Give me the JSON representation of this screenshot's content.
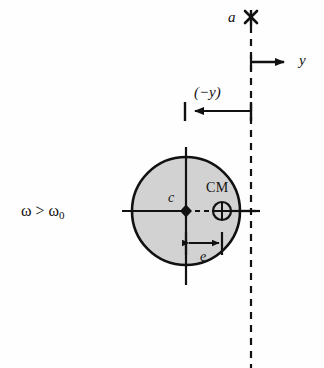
{
  "figure": {
    "type": "physics-diagram",
    "labels": {
      "axis_point": "a",
      "y_axis": "y",
      "displacement": "(−y)",
      "geometric_center": "c",
      "center_of_mass": "CM",
      "eccentricity": "e",
      "condition_omega": "ω",
      "condition_operator": ">",
      "condition_omega0": "ω",
      "condition_omega0_sub": "0"
    },
    "geometry": {
      "disk_center_x": 186,
      "disk_center_y": 211,
      "disk_radius": 54,
      "bearing_line_x": 251,
      "cm_x": 222,
      "cm_y": 211,
      "cm_radius": 9,
      "y_arrow_y": 62,
      "y_arrow_end_x": 292,
      "dim_neg_y_y": 111,
      "dim_neg_y_left_x": 185,
      "dim_e_y": 243,
      "vertical_center_top_y": 147,
      "vertical_center_bottom_y": 285,
      "h_axis_left_x": 122,
      "h_axis_right_x": 256
    },
    "colors": {
      "disk_fill": "#d2d2d2",
      "stroke": "#111111",
      "background": "#fefefe"
    }
  }
}
